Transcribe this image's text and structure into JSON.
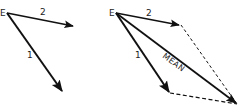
{
  "diagram": {
    "colors": {
      "stroke": "#111111",
      "background": "#ffffff",
      "text": "#222222"
    },
    "left_panel": {
      "origin_label": "E",
      "vectors": [
        {
          "label": "2",
          "style": "solid"
        },
        {
          "label": "1",
          "style": "solid"
        }
      ]
    },
    "right_panel": {
      "origin_label": "E",
      "vectors": [
        {
          "label": "2",
          "style": "solid"
        },
        {
          "label": "1",
          "style": "solid"
        },
        {
          "label": "MEAN",
          "style": "solid"
        }
      ],
      "construction_lines": [
        {
          "from": "tip of 2",
          "to": "tip of MEAN",
          "style": "dashed"
        },
        {
          "from": "tip of 1",
          "to": "tip of MEAN",
          "style": "dashed"
        }
      ]
    }
  }
}
